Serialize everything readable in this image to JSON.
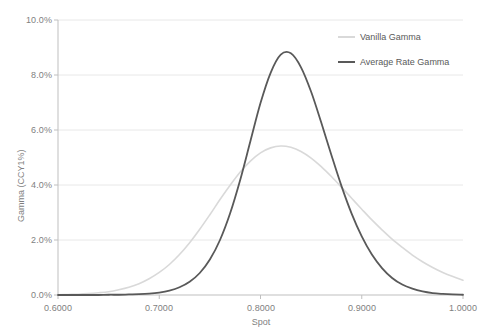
{
  "chart_data": {
    "type": "line",
    "title": "",
    "subtitle": "",
    "xlabel": "Spot",
    "ylabel": "Gamma (CCY1%)",
    "xlim": [
      0.6,
      1.0
    ],
    "ylim": [
      0.0,
      10.0
    ],
    "grid": true,
    "grid_axis": "y",
    "legend_position": "top-right",
    "x_tick_labels": [
      "0.6000",
      "0.7000",
      "0.8000",
      "0.9000",
      "1.0000"
    ],
    "x_tick_values": [
      0.6,
      0.7,
      0.8,
      0.9,
      1.0
    ],
    "y_tick_labels": [
      "0.0%",
      "2.0%",
      "4.0%",
      "6.0%",
      "8.0%",
      "10.0%"
    ],
    "y_tick_values": [
      0.0,
      2.0,
      4.0,
      6.0,
      8.0,
      10.0
    ],
    "y_unit": "%",
    "x": [
      0.6,
      0.61,
      0.62,
      0.63,
      0.64,
      0.65,
      0.66,
      0.67,
      0.68,
      0.69,
      0.7,
      0.71,
      0.72,
      0.73,
      0.74,
      0.75,
      0.76,
      0.77,
      0.78,
      0.79,
      0.8,
      0.81,
      0.82,
      0.83,
      0.84,
      0.85,
      0.86,
      0.87,
      0.88,
      0.89,
      0.9,
      0.91,
      0.92,
      0.93,
      0.94,
      0.95,
      0.96,
      0.97,
      0.98,
      0.99,
      1.0
    ],
    "series": [
      {
        "name": "Vanilla Gamma",
        "color": "#d9d9d9",
        "line_width": 1.6,
        "peak_x": 0.822,
        "peak_y": 5.42,
        "values": [
          0.01,
          0.02,
          0.03,
          0.05,
          0.08,
          0.12,
          0.19,
          0.28,
          0.41,
          0.59,
          0.82,
          1.11,
          1.47,
          1.9,
          2.39,
          2.92,
          3.47,
          3.99,
          4.47,
          4.87,
          5.17,
          5.35,
          5.42,
          5.37,
          5.22,
          4.98,
          4.67,
          4.31,
          3.92,
          3.52,
          3.12,
          2.73,
          2.37,
          2.03,
          1.73,
          1.45,
          1.21,
          1.0,
          0.82,
          0.67,
          0.54
        ]
      },
      {
        "name": "Average Rate Gamma",
        "color": "#595959",
        "line_width": 1.8,
        "peak_x": 0.822,
        "peak_y": 8.8,
        "values": [
          0.0,
          0.0,
          0.0,
          0.0,
          0.0,
          0.01,
          0.01,
          0.02,
          0.03,
          0.05,
          0.09,
          0.16,
          0.28,
          0.48,
          0.8,
          1.29,
          2.0,
          2.97,
          4.19,
          5.59,
          6.98,
          8.08,
          8.74,
          8.79,
          8.28,
          7.39,
          6.27,
          5.09,
          3.96,
          2.96,
          2.13,
          1.47,
          0.98,
          0.62,
          0.38,
          0.23,
          0.13,
          0.07,
          0.04,
          0.02,
          0.01
        ]
      }
    ]
  },
  "plot_area": {
    "left": 58,
    "top": 20,
    "right": 463,
    "bottom": 295
  },
  "legend": {
    "entries": [
      {
        "label": "Vanilla Gamma",
        "color": "#d9d9d9"
      },
      {
        "label": "Average Rate Gamma",
        "color": "#595959"
      }
    ]
  },
  "axes": {
    "x_title": "Spot",
    "y_title": "Gamma (CCY1%)"
  },
  "style": {
    "background": "#ffffff",
    "grid_color": "#e8e8e8",
    "axis_color": "#bfbfbf",
    "tick_text_color": "#7f7f7f"
  }
}
